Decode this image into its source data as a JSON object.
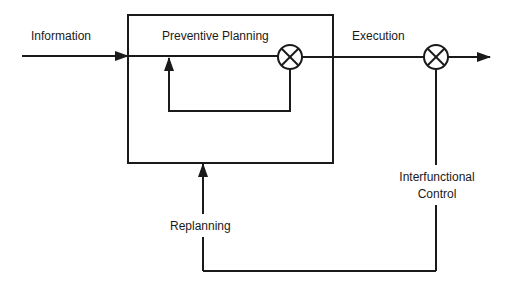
{
  "diagram": {
    "type": "control-loop block diagram",
    "colors": {
      "line": "#1a1a1a",
      "background": "#ffffff"
    },
    "labels": {
      "information": "Information",
      "preventive_planning": "Preventive Planning",
      "execution": "Execution",
      "interfunctional_control_line1": "Interfunctional",
      "interfunctional_control_line2": "Control",
      "replanning": "Replanning"
    },
    "nodes": [
      {
        "id": "preventive-planning-box",
        "shape": "rectangle",
        "label": "Preventive Planning"
      },
      {
        "id": "summing-junction-1",
        "shape": "circle-x",
        "location": "inside planning box"
      },
      {
        "id": "summing-junction-2",
        "shape": "circle-x",
        "location": "execution path"
      }
    ],
    "edges": [
      {
        "from": "Information",
        "to": "preventive-planning-box"
      },
      {
        "from": "summing-junction-1",
        "to": "inner loop feedback",
        "label": ""
      },
      {
        "from": "preventive-planning-box",
        "to": "summing-junction-2",
        "label": "Execution"
      },
      {
        "from": "summing-junction-2",
        "to": "output"
      },
      {
        "from": "summing-junction-2",
        "to": "preventive-planning-box",
        "label": "Interfunctional Control / Replanning"
      }
    ]
  }
}
